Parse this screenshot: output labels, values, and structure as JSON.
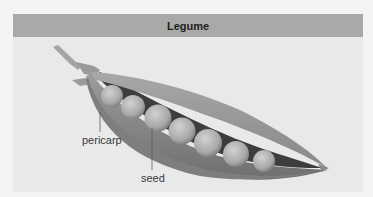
{
  "figure": {
    "title": "Legume",
    "labels": {
      "pericarp": "pericarp",
      "seed": "seed"
    },
    "colors": {
      "header_bg": "#a9a9a9",
      "panel_bg": "#e9e9e9",
      "pod": "#8a8a8a",
      "seed": "#b5b5b5"
    }
  }
}
